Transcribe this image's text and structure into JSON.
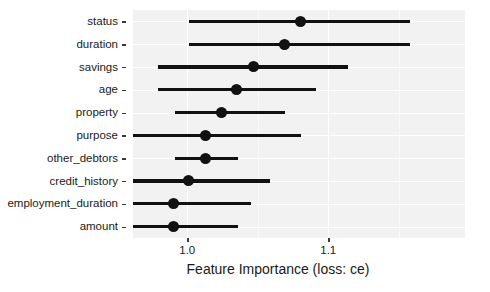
{
  "chart_data": {
    "type": "bar",
    "subtype": "dot-and-interval (horizontal error bars)",
    "title": "",
    "xlabel": "Feature Importance (loss: ce)",
    "ylabel": "",
    "xlim": [
      0.9615,
      1.197
    ],
    "xticks": [
      1.0,
      1.1
    ],
    "xticklabels": [
      "1.0",
      "1.1"
    ],
    "grid": true,
    "grid_orientation": "both",
    "legend": "none",
    "categories": [
      "status",
      "duration",
      "savings",
      "age",
      "property",
      "purpose",
      "other_debtors",
      "credit_history",
      "employment_duration",
      "amount"
    ],
    "values": [
      1.08,
      1.069,
      1.047,
      1.035,
      1.024,
      1.013,
      1.013,
      1.001,
      0.99,
      0.99
    ],
    "lower": [
      1.001,
      1.001,
      0.979,
      0.979,
      0.991,
      0.946,
      0.991,
      0.933,
      0.933,
      0.933
    ],
    "upper": [
      1.158,
      1.158,
      1.114,
      1.091,
      1.069,
      1.081,
      1.036,
      1.059,
      1.045,
      1.036
    ],
    "series": [
      {
        "name": "Feature Importance (loss: ce)",
        "points": [
          {
            "feature": "status",
            "value": 1.08,
            "lower": 1.001,
            "upper": 1.158
          },
          {
            "feature": "duration",
            "value": 1.069,
            "lower": 1.001,
            "upper": 1.158
          },
          {
            "feature": "savings",
            "value": 1.047,
            "lower": 0.979,
            "upper": 1.114
          },
          {
            "feature": "age",
            "value": 1.035,
            "lower": 0.979,
            "upper": 1.091
          },
          {
            "feature": "property",
            "value": 1.024,
            "lower": 0.991,
            "upper": 1.069
          },
          {
            "feature": "purpose",
            "value": 1.013,
            "lower": 0.946,
            "upper": 1.081
          },
          {
            "feature": "other_debtors",
            "value": 1.013,
            "lower": 0.991,
            "upper": 1.036
          },
          {
            "feature": "credit_history",
            "value": 1.001,
            "lower": 0.933,
            "upper": 1.059
          },
          {
            "feature": "employment_duration",
            "value": 0.99,
            "lower": 0.933,
            "upper": 1.045
          },
          {
            "feature": "amount",
            "value": 0.99,
            "lower": 0.933,
            "upper": 1.036
          }
        ]
      }
    ],
    "colors": {
      "panel_background": "#f2f2f2",
      "gridline": "#ffffff",
      "mark": "#111111",
      "text": "#1a1a1a",
      "page_background": "#ffffff"
    }
  },
  "axis": {
    "x_title": "Feature Importance (loss: ce)",
    "x_tick_labels": [
      "1.0",
      "1.1"
    ],
    "y_tick_labels": [
      "status",
      "duration",
      "savings",
      "age",
      "property",
      "purpose",
      "other_debtors",
      "credit_history",
      "employment_duration",
      "amount"
    ]
  }
}
